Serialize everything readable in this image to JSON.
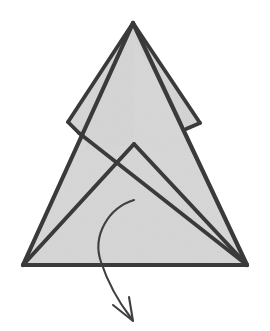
{
  "figure": {
    "title": "Origami folding step diagram",
    "kind": "line-drawing",
    "background_color": "#ffffff",
    "paper_fill_color": "#d7d7d7",
    "paper_fill_color_shaded": "#d2d2d2",
    "ink_color": "#3a3a3a",
    "arrow_color": "#3f3f3f",
    "canvas": {
      "width": 270,
      "height": 331
    }
  },
  "shapes": {
    "main_triangle": {
      "name": "main-triangle-body",
      "description": "Large upward pointing triangle forming the body of the model",
      "points": "133,23 247,265 23,265",
      "apex": {
        "x": 133,
        "y": 23
      },
      "bottom_left": {
        "x": 23,
        "y": 265
      },
      "bottom_right": {
        "x": 247,
        "y": 265
      }
    },
    "right_sliver_flap": {
      "name": "right-sliver-flap",
      "description": "Narrow folded sliver of paper along the upper right edge",
      "points": "133,23 200,123 186,129 131,34",
      "tip": {
        "x": 200,
        "y": 123
      }
    },
    "left_upper_flap": {
      "name": "left-upper-flap",
      "description": "Upper-left folded flap with a square notch corner",
      "points": "133,23 68,122 92,151 133,144",
      "notch_corner": {
        "x": 68,
        "y": 122
      }
    },
    "inner_peak_flap": {
      "name": "inner-peak-flap",
      "description": "Inner lower triangle peak overlapping the main body",
      "points": "134,144 247,265 23,265",
      "peak": {
        "x": 134,
        "y": 144
      }
    }
  },
  "fold_lines": [
    {
      "name": "fold-line-apex-to-right-tip",
      "description": "Crease from the apex down to the right sliver tip",
      "d": "M 133,23 L 200,123"
    },
    {
      "name": "fold-line-right-sliver-inner",
      "description": "Inner edge of the narrow right sliver running back toward the apex",
      "d": "M 200,123 L 186,129"
    },
    {
      "name": "fold-line-apex-to-left-notch",
      "description": "Crease from apex down-left to the notch corner of the left flap",
      "d": "M 133,23 L 68,122"
    },
    {
      "name": "fold-line-left-notch-step",
      "description": "Short step at the left notch corner",
      "d": "M 68,122 L 79,133"
    },
    {
      "name": "fold-line-left-notch-to-bottom-right",
      "description": "Long crease from the left notch running down-right to the bottom right corner",
      "d": "M 79,133 L 247,265"
    },
    {
      "name": "fold-line-inner-peak-left",
      "description": "Left edge of the inner peak down to bottom-left corner",
      "d": "M 134,144 L 23,265"
    },
    {
      "name": "fold-line-inner-peak-right",
      "description": "Right edge of the inner peak down to bottom-right corner",
      "d": "M 134,144 L 247,265"
    },
    {
      "name": "fold-line-base-edge",
      "description": "Bottom base edge of the model",
      "d": "M 23,265 L 247,265"
    },
    {
      "name": "fold-line-main-left-edge",
      "description": "Outer left edge of the main triangle",
      "d": "M 133,23 L 23,265"
    },
    {
      "name": "fold-line-main-right-edge",
      "description": "Outer right edge of the main triangle",
      "d": "M 133,23 L 247,265"
    }
  ],
  "arrow": {
    "name": "fold-direction-arrow",
    "description": "Curved arrow indicating the flap is folded downward and outward",
    "start": {
      "x": 134,
      "y": 200
    },
    "tip": {
      "x": 134,
      "y": 321
    },
    "path_d": "M 134,200 C 108,208 92,236 101,262 C 110,289 121,305 131,318",
    "head_d": "M 113,305 L 133,321 L 129,297",
    "stroke_width": 2.1
  },
  "stroke_widths": {
    "outline": 4.2,
    "inner_fold": 3.8
  }
}
